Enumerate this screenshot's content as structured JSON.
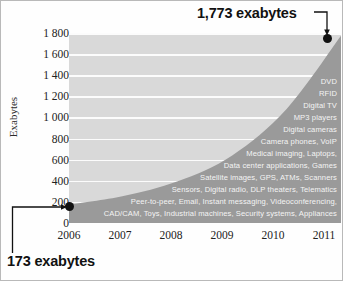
{
  "chart_data": {
    "type": "area",
    "title": "",
    "xlabel": "",
    "ylabel": "Exabytes",
    "x": [
      2006,
      2007,
      2008,
      2009,
      2010,
      2011
    ],
    "categories": [
      "2006",
      "2007",
      "2008",
      "2009",
      "2010",
      "2011"
    ],
    "values": [
      173,
      255,
      395,
      640,
      1080,
      1773
    ],
    "ylim": [
      0,
      1800
    ],
    "xlim": [
      2006,
      2011
    ],
    "yticks": [
      0,
      200,
      400,
      600,
      800,
      1000,
      1200,
      1400,
      1600,
      1800
    ],
    "ytick_labels": [
      "0",
      "200",
      "400",
      "600",
      "800",
      "1 000",
      "1 200",
      "1 400",
      "1 600",
      "1 800"
    ],
    "xtick_labels": [
      "2006",
      "2007",
      "2008",
      "2009",
      "2010",
      "2011"
    ],
    "grid": true,
    "legend": "none",
    "series": [
      {
        "name": "Exabytes",
        "values": [
          173,
          255,
          395,
          640,
          1080,
          1773
        ]
      }
    ],
    "annotations": [
      {
        "label": "1,773 exabytes",
        "x": 2011,
        "y": 1773,
        "position": "top-right"
      },
      {
        "label": "173 exabytes",
        "x": 2006,
        "y": 173,
        "position": "bottom-left"
      }
    ],
    "inline_labels": [
      "DVD",
      "RFID",
      "Digital TV",
      "MP3 players",
      "Digital cameras",
      "Camera phones, VoIP",
      "Medical imaging, Laptops,",
      "Data center applications, Games",
      "Satellite images, GPS, ATMs, Scanners",
      "Sensors, Digital radio, DLP theaters, Telematics",
      "Peer-to-peer, Email, Instant messaging, Videoconferencing,",
      "CAD/CAM, Toys, Industrial machines, Security systems, Appliances"
    ],
    "colors": {
      "plot_background": "#d9d9d9",
      "area_fill": "#9a9a9a",
      "gridline": "#fcfcfc",
      "marker": "#111111",
      "label_text": "#f4f4f4"
    }
  },
  "axis": {
    "y_title": "Exabytes",
    "y_ticks": [
      "1 800",
      "1 600",
      "1 400",
      "1 200",
      "1 000",
      "800",
      "600",
      "400",
      "200",
      "0"
    ],
    "x_ticks": [
      "2006",
      "2007",
      "2008",
      "2009",
      "2010",
      "2011"
    ]
  },
  "callouts": {
    "top": "1,773 exabytes",
    "bottom": "173 exabytes"
  },
  "labels": {
    "l0": "DVD",
    "l1": "RFID",
    "l2": "Digital TV",
    "l3": "MP3 players",
    "l4": "Digital cameras",
    "l5": "Camera phones, VoIP",
    "l6": "Medical imaging, Laptops,",
    "l7": "Data center applications, Games",
    "l8": "Satellite images, GPS, ATMs, Scanners",
    "l9": "Sensors, Digital radio, DLP theaters, Telematics",
    "l10": "Peer-to-peer, Email, Instant messaging, Videoconferencing,",
    "l11": "CAD/CAM, Toys, Industrial machines, Security systems, Appliances"
  }
}
